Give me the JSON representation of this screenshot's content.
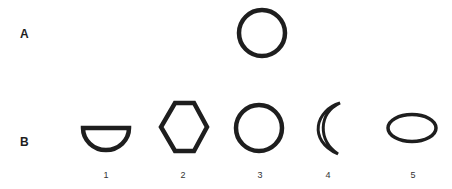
{
  "rows": {
    "a": {
      "label": "A"
    },
    "b": {
      "label": "B"
    }
  },
  "target_shape": "circle",
  "options": [
    {
      "number": "1",
      "shape": "half-disc"
    },
    {
      "number": "2",
      "shape": "hexagon"
    },
    {
      "number": "3",
      "shape": "circle"
    },
    {
      "number": "4",
      "shape": "crescent"
    },
    {
      "number": "5",
      "shape": "ellipse"
    }
  ],
  "colors": {
    "stroke": "#1e1e1e",
    "background": "#ffffff"
  }
}
